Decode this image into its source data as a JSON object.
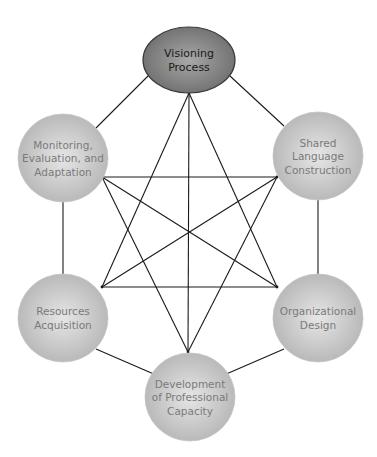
{
  "diagram": {
    "type": "network",
    "nodes": [
      {
        "id": "visioning",
        "lines": [
          "Visioning",
          "Process"
        ],
        "primary": true,
        "cx": 189,
        "cy": 60,
        "rx": 46,
        "ry": 33,
        "fill_center": "#a8a8a8",
        "fill_edge": "#6e6e6e",
        "anchor": [
          189,
          93
        ]
      },
      {
        "id": "monitoring",
        "lines": [
          "Monitoring,",
          "Evaluation, and",
          "Adaptation"
        ],
        "primary": false,
        "cx": 63,
        "cy": 158,
        "rx": 45,
        "ry": 44,
        "fill_center": "#e6e6e6",
        "fill_edge": "#b5b5b5",
        "anchor": [
          102,
          177
        ]
      },
      {
        "id": "shared-language",
        "lines": [
          "Shared",
          "Language",
          "Construction"
        ],
        "primary": false,
        "cx": 318,
        "cy": 156,
        "rx": 45,
        "ry": 44,
        "fill_center": "#e6e6e6",
        "fill_edge": "#b5b5b5",
        "anchor": [
          277,
          177
        ]
      },
      {
        "id": "resources",
        "lines": [
          "Resources",
          "Acquisition"
        ],
        "primary": false,
        "cx": 63,
        "cy": 318,
        "rx": 45,
        "ry": 44,
        "fill_center": "#e6e6e6",
        "fill_edge": "#b5b5b5",
        "anchor": [
          102,
          287
        ]
      },
      {
        "id": "organizational",
        "lines": [
          "Organizational",
          "Design"
        ],
        "primary": false,
        "cx": 318,
        "cy": 318,
        "rx": 45,
        "ry": 44,
        "fill_center": "#e6e6e6",
        "fill_edge": "#b5b5b5",
        "anchor": [
          277,
          287
        ]
      },
      {
        "id": "professional-capacity",
        "lines": [
          "Development",
          "of Professional",
          "Capacity"
        ],
        "primary": false,
        "cx": 190,
        "cy": 397,
        "rx": 45,
        "ry": 44,
        "fill_center": "#e6e6e6",
        "fill_edge": "#b5b5b5",
        "anchor": [
          188,
          352
        ]
      }
    ],
    "outer_edges": [
      [
        [
          148,
          76
        ],
        [
          96,
          128
        ]
      ],
      [
        [
          230,
          76
        ],
        [
          284,
          126
        ]
      ],
      [
        [
          63,
          202
        ],
        [
          63,
          274
        ]
      ],
      [
        [
          318,
          200
        ],
        [
          318,
          274
        ]
      ],
      [
        [
          96,
          349
        ],
        [
          156,
          375
        ]
      ],
      [
        [
          284,
          349
        ],
        [
          224,
          375
        ]
      ]
    ],
    "inner_edges": [
      [
        "visioning",
        "resources"
      ],
      [
        "visioning",
        "organizational"
      ],
      [
        "visioning",
        "professional-capacity"
      ],
      [
        "monitoring",
        "shared-language"
      ],
      [
        "monitoring",
        "organizational"
      ],
      [
        "monitoring",
        "professional-capacity"
      ],
      [
        "shared-language",
        "resources"
      ],
      [
        "shared-language",
        "professional-capacity"
      ],
      [
        "resources",
        "organizational"
      ]
    ],
    "colors": {
      "edge": "#1a1a1a",
      "primary_text": "#1a1a1a",
      "secondary_text": "#7a7a7a",
      "background": "#ffffff"
    }
  }
}
